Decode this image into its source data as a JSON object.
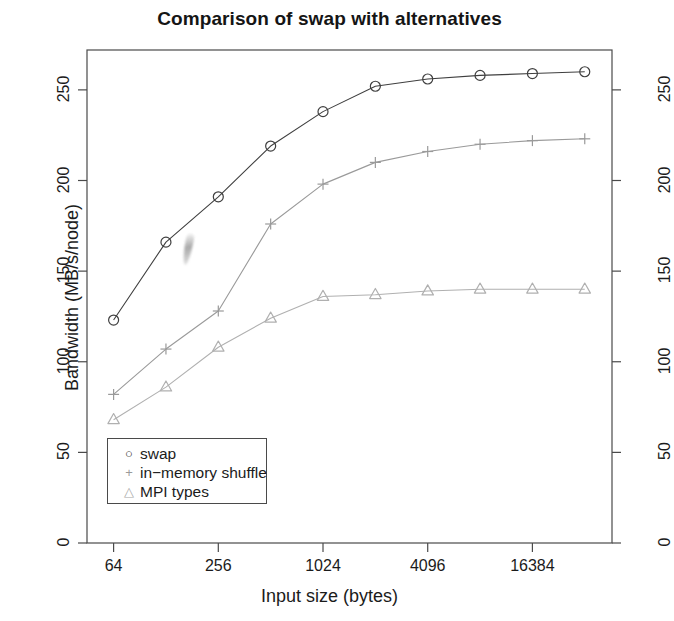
{
  "chart_data": {
    "type": "line",
    "title": "Comparison of swap with alternatives",
    "xlabel": "Input size (bytes)",
    "ylabel": "Bandwidth (MB/s/node)",
    "x": [
      64,
      128,
      256,
      512,
      1024,
      2048,
      4096,
      8192,
      16384,
      32768
    ],
    "x_scale": "log2",
    "x_ticks": [
      64,
      256,
      1024,
      4096,
      16384
    ],
    "x_tick_labels": [
      "64",
      "256",
      "1024",
      "4096",
      "16384"
    ],
    "xlim": [
      45,
      47000
    ],
    "y_ticks": [
      0,
      50,
      100,
      150,
      200,
      250
    ],
    "y_tick_labels": [
      "0",
      "50",
      "100",
      "150",
      "200",
      "250"
    ],
    "ylim": [
      0,
      272
    ],
    "grid": false,
    "right_axis_mirrored": true,
    "legend_position": "bottom-left",
    "series": [
      {
        "name": "swap",
        "marker": "circle",
        "color": "#3f3f3f",
        "values": [
          123,
          166,
          191,
          219,
          238,
          252,
          256,
          258,
          259,
          260
        ]
      },
      {
        "name": "in−memory shuffle",
        "marker": "plus",
        "color": "#9a9a9a",
        "values": [
          82,
          107,
          128,
          176,
          198,
          210,
          216,
          220,
          222,
          223
        ]
      },
      {
        "name": "MPI types",
        "marker": "triangle",
        "color": "#b0b0b0",
        "values": [
          68,
          86,
          108,
          124,
          136,
          137,
          139,
          140,
          140,
          140
        ]
      }
    ]
  },
  "legend": {
    "items": [
      {
        "symbol": "○",
        "label": "swap"
      },
      {
        "symbol": "+",
        "label": "in−memory shuffle"
      },
      {
        "symbol": "△",
        "label": "MPI types"
      }
    ]
  },
  "colors": {
    "swap": "#3f3f3f",
    "shuffle": "#9a9a9a",
    "mpi": "#b0b0b0",
    "axis": "#4a4a4a",
    "text": "#1b1b1b",
    "background": "#ffffff"
  },
  "annotations": {
    "smudge": "scan-artifact"
  }
}
